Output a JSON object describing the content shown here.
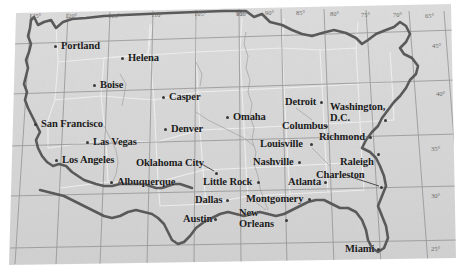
{
  "figure": {
    "name": "usa-cities-map",
    "type": "map",
    "projection_note": "conic",
    "background_color": "#ffffff",
    "land_color": "#d8d8d8",
    "coast_color": "#585858",
    "grid_color": "#8d8d8d",
    "state_color": "#eeeeee",
    "label_color": "#1b1b1b",
    "tick_color": "#6d6d6d"
  },
  "graticule": {
    "longitude_labels": [
      {
        "text": "125°",
        "x": 29,
        "y": 12
      },
      {
        "text": "120°",
        "x": 65,
        "y": 12
      },
      {
        "text": "115°",
        "x": 108,
        "y": 12
      },
      {
        "text": "110°",
        "x": 151,
        "y": 11
      },
      {
        "text": "105°",
        "x": 194,
        "y": 10
      },
      {
        "text": "100°",
        "x": 236,
        "y": 10
      },
      {
        "text": "95°",
        "x": 236,
        "y": 10
      },
      {
        "text": "90°",
        "x": 265,
        "y": 9
      },
      {
        "text": "85°",
        "x": 296,
        "y": 9
      },
      {
        "text": "80°",
        "x": 330,
        "y": 10
      },
      {
        "text": "75°",
        "x": 361,
        "y": 11
      },
      {
        "text": "70°",
        "x": 393,
        "y": 11
      },
      {
        "text": "65°",
        "x": 425,
        "y": 12
      }
    ],
    "longitude_values": [
      125,
      120,
      115,
      110,
      105,
      100,
      95,
      90,
      85,
      80,
      75,
      70,
      65
    ],
    "latitude_labels": [
      {
        "text": "45°",
        "x": 432,
        "y": 42
      },
      {
        "text": "40°",
        "x": 436,
        "y": 90
      },
      {
        "text": "35°",
        "x": 431,
        "y": 145
      },
      {
        "text": "30°",
        "x": 431,
        "y": 192
      },
      {
        "text": "25°",
        "x": 431,
        "y": 245
      }
    ],
    "latitude_values": [
      45,
      40,
      35,
      30,
      25
    ]
  },
  "cities": [
    {
      "name": "Portland",
      "label": "Portland",
      "x": 61,
      "y": 41,
      "dot_x": 54,
      "dot_y": 45,
      "dot_side": "left"
    },
    {
      "name": "Helena",
      "label": "Helena",
      "x": 128,
      "y": 53,
      "dot_x": 121,
      "dot_y": 57,
      "dot_side": "left"
    },
    {
      "name": "Boise",
      "label": "Boise",
      "x": 100,
      "y": 80,
      "dot_x": 93,
      "dot_y": 84,
      "dot_side": "left"
    },
    {
      "name": "Casper",
      "label": "Casper",
      "x": 169,
      "y": 92,
      "dot_x": 162,
      "dot_y": 96,
      "dot_side": "left"
    },
    {
      "name": "San Francisco",
      "label": "San Francisco",
      "x": 41,
      "y": 119,
      "dot_x": 34,
      "dot_y": 123,
      "dot_side": "left"
    },
    {
      "name": "Denver",
      "label": "Denver",
      "x": 171,
      "y": 124,
      "dot_x": 164,
      "dot_y": 128,
      "dot_side": "left"
    },
    {
      "name": "Las Vegas",
      "label": "Las Vegas",
      "x": 93,
      "y": 137,
      "dot_x": 86,
      "dot_y": 141,
      "dot_side": "left"
    },
    {
      "name": "Los Angeles",
      "label": "Los Angeles",
      "x": 62,
      "y": 155,
      "dot_x": 55,
      "dot_y": 159,
      "dot_side": "left"
    },
    {
      "name": "Albuquerque",
      "label": "Albuquerque",
      "x": 117,
      "y": 177,
      "dot_x": 110,
      "dot_y": 181,
      "dot_side": "left"
    },
    {
      "name": "Oklahoma City",
      "label": "Oklahoma City",
      "x": 136,
      "y": 158,
      "dot_x": 215,
      "dot_y": 172,
      "dot_side": "leader"
    },
    {
      "name": "Little Rock",
      "label": "Little Rock",
      "x": 203,
      "y": 177,
      "dot_x": 257,
      "dot_y": 181,
      "dot_side": "right"
    },
    {
      "name": "Dallas",
      "label": "Dallas",
      "x": 195,
      "y": 195,
      "dot_x": 226,
      "dot_y": 199,
      "dot_side": "right"
    },
    {
      "name": "Austin",
      "label": "Austin",
      "x": 183,
      "y": 214,
      "dot_x": 214,
      "dot_y": 218,
      "dot_side": "right"
    },
    {
      "name": "Omaha",
      "label": "Omaha",
      "x": 233,
      "y": 112,
      "dot_x": 226,
      "dot_y": 116,
      "dot_side": "left"
    },
    {
      "name": "Columbus",
      "label": "Columbus",
      "x": 282,
      "y": 121,
      "dot_x": 325,
      "dot_y": 125,
      "dot_side": "right"
    },
    {
      "name": "Detroit",
      "label": "Detroit",
      "x": 285,
      "y": 97,
      "dot_x": 320,
      "dot_y": 101,
      "dot_side": "right"
    },
    {
      "name": "Washington, D.C.",
      "label": "Washington,",
      "label2": "D.C.",
      "x": 330,
      "y": 102,
      "dot_x": 384,
      "dot_y": 119,
      "dot_side": "right"
    },
    {
      "name": "Louisville",
      "label": "Louisville",
      "x": 260,
      "y": 139,
      "dot_x": 310,
      "dot_y": 143,
      "dot_side": "right"
    },
    {
      "name": "Richmond",
      "label": "Richmond",
      "x": 319,
      "y": 132,
      "dot_x": 369,
      "dot_y": 136,
      "dot_side": "right"
    },
    {
      "name": "Nashville",
      "label": "Nashville",
      "x": 253,
      "y": 157,
      "dot_x": 298,
      "dot_y": 161,
      "dot_side": "right"
    },
    {
      "name": "Raleigh",
      "label": "Raleigh",
      "x": 340,
      "y": 157,
      "dot_x": 377,
      "dot_y": 153,
      "dot_side": "right"
    },
    {
      "name": "Charleston",
      "label": "Charleston",
      "x": 316,
      "y": 170,
      "dot_x": 380,
      "dot_y": 186,
      "dot_side": "leader"
    },
    {
      "name": "Atlanta",
      "label": "Atlanta",
      "x": 288,
      "y": 177,
      "dot_x": 324,
      "dot_y": 181,
      "dot_side": "right"
    },
    {
      "name": "Montgomery",
      "label": "Montgomery",
      "x": 246,
      "y": 194,
      "dot_x": 308,
      "dot_y": 198,
      "dot_side": "right"
    },
    {
      "name": "New Orleans",
      "label": "New",
      "label2": "Orleans",
      "x": 239,
      "y": 208,
      "dot_x": 285,
      "dot_y": 219,
      "dot_side": "right"
    },
    {
      "name": "Miami",
      "label": "Miami",
      "x": 345,
      "y": 244,
      "dot_x": 377,
      "dot_y": 248,
      "dot_side": "right"
    }
  ]
}
